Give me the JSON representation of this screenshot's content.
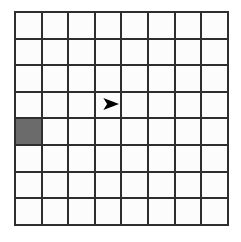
{
  "board": {
    "name": "grid-board",
    "columns": 8,
    "rows": 8,
    "origin_x": 14,
    "origin_y": 11,
    "cell_size": 26.6,
    "line_thickness": 2,
    "line_color": "#2e2e2e",
    "cell_color": "#fcfcfc",
    "background_color": "#ffffff"
  },
  "filled_cells": [
    {
      "name": "filled-cell",
      "column": 1,
      "row": 5,
      "color": "#6b6b6b",
      "label": ""
    }
  ],
  "markers": [
    {
      "name": "arrow-marker",
      "icon": "right-arrowhead-icon",
      "column": 4,
      "row": 4,
      "direction": "right",
      "color": "#000000",
      "offset_x": 0.62,
      "offset_y": 0.48,
      "width": 17,
      "height": 12,
      "label": ""
    }
  ]
}
